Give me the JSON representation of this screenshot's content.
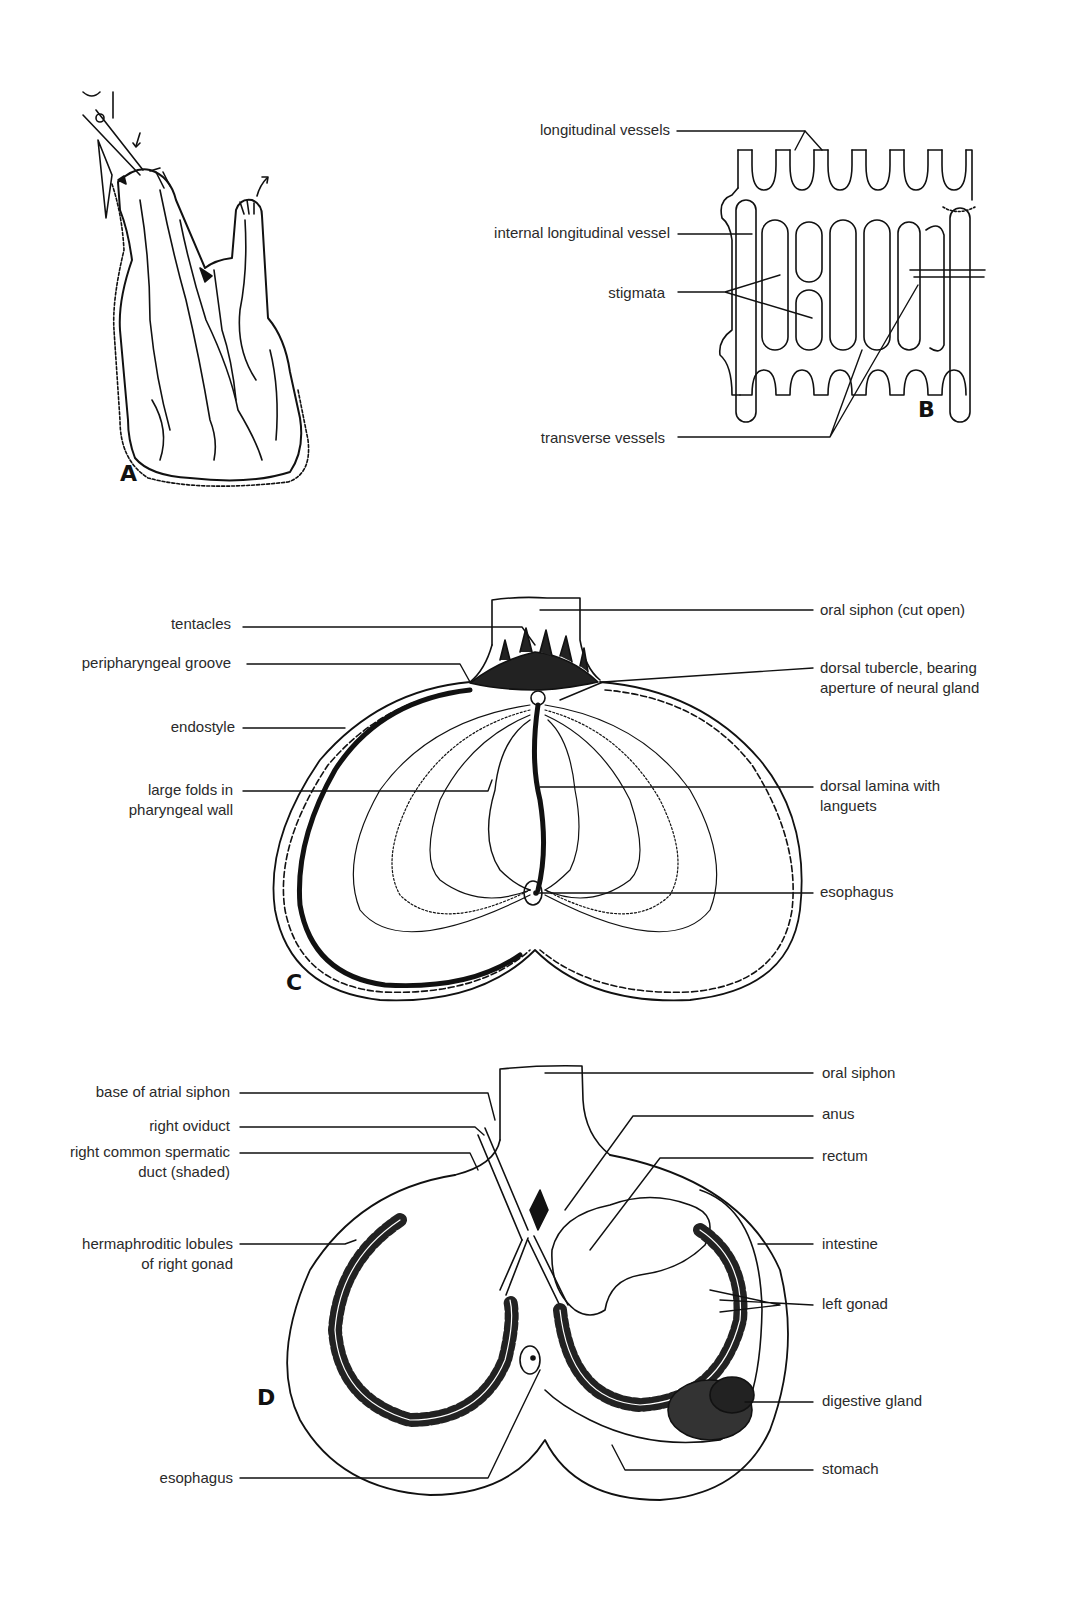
{
  "figure": {
    "panels": [
      {
        "id": "A",
        "letter": "A"
      },
      {
        "id": "B",
        "letter": "B"
      },
      {
        "id": "C",
        "letter": "C"
      },
      {
        "id": "D",
        "letter": "D"
      }
    ],
    "labels": {
      "B": {
        "longitudinal_vessels": "longitudinal vessels",
        "internal_longitudinal_vessel": "internal longitudinal vessel",
        "stigmata": "stigmata",
        "transverse_vessels": "transverse vessels"
      },
      "C": {
        "tentacles": "tentacles",
        "peripharyngeal_groove": "peripharyngeal groove",
        "endostyle": "endostyle",
        "large_folds_1": "large folds in",
        "large_folds_2": "pharyngeal wall",
        "oral_siphon_cut_open": "oral siphon (cut open)",
        "dorsal_tubercle_1": "dorsal tubercle, bearing",
        "dorsal_tubercle_2": "aperture of neural gland",
        "dorsal_lamina_1": "dorsal lamina with",
        "dorsal_lamina_2": "languets",
        "esophagus": "esophagus"
      },
      "D": {
        "base_of_atrial_siphon": "base of atrial siphon",
        "right_oviduct": "right oviduct",
        "right_common_spermatic_1": "right common spermatic",
        "right_common_spermatic_2": "duct (shaded)",
        "hermaphroditic_1": "hermaphroditic lobules",
        "hermaphroditic_2": "of right gonad",
        "esophagus": "esophagus",
        "oral_siphon": "oral siphon",
        "anus": "anus",
        "rectum": "rectum",
        "intestine": "intestine",
        "left_gonad": "left gonad",
        "digestive_gland": "digestive gland",
        "stomach": "stomach"
      }
    }
  }
}
